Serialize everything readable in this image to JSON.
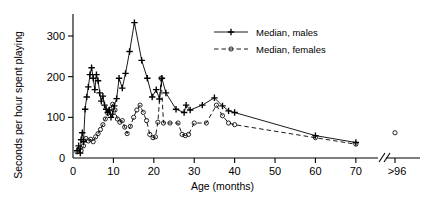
{
  "chart_data": {
    "type": "line",
    "title": "",
    "xlabel": "Age (months)",
    "ylabel": "Seconds per hour spent playing",
    "xlim": [
      0,
      74
    ],
    "ylim": [
      0,
      340
    ],
    "grid": false,
    "legend_position": "top-right",
    "x_ticks": [
      0,
      10,
      20,
      30,
      40,
      50,
      60,
      70
    ],
    "x_tick_labels": [
      "0",
      "10",
      "20",
      "30",
      "40",
      "50",
      "60",
      "70"
    ],
    "axis_break_label": ">96",
    "axis_break_symbol": "//",
    "y_ticks": [
      0,
      100,
      200,
      300
    ],
    "y_tick_labels": [
      "0",
      "100",
      "200",
      "300"
    ],
    "series": [
      {
        "name": "Median, males",
        "marker": "plus",
        "linestyle": "solid",
        "points": [
          [
            1.0,
            18
          ],
          [
            1.4,
            30
          ],
          [
            1.8,
            12
          ],
          [
            2.0,
            45
          ],
          [
            2.3,
            62
          ],
          [
            2.6,
            40
          ],
          [
            3.0,
            120
          ],
          [
            3.4,
            150
          ],
          [
            3.8,
            175
          ],
          [
            4.2,
            205
          ],
          [
            4.6,
            222
          ],
          [
            5.0,
            196
          ],
          [
            5.4,
            168
          ],
          [
            5.8,
            205
          ],
          [
            6.2,
            190
          ],
          [
            6.6,
            160
          ],
          [
            7.0,
            140
          ],
          [
            7.4,
            152
          ],
          [
            7.8,
            130
          ],
          [
            8.2,
            120
          ],
          [
            8.6,
            112
          ],
          [
            9.0,
            118
          ],
          [
            9.4,
            100
          ],
          [
            9.8,
            108
          ],
          [
            10.2,
            128
          ],
          [
            10.8,
            146
          ],
          [
            11.4,
            196
          ],
          [
            12.2,
            172
          ],
          [
            13.0,
            208
          ],
          [
            14.0,
            262
          ],
          [
            15.2,
            333
          ],
          [
            17.0,
            240
          ],
          [
            18.4,
            196
          ],
          [
            19.6,
            150
          ],
          [
            20.6,
            168
          ],
          [
            21.4,
            145
          ],
          [
            22.0,
            196
          ],
          [
            23.0,
            160
          ],
          [
            25.5,
            120
          ],
          [
            27.5,
            112
          ],
          [
            28.0,
            130
          ],
          [
            29.0,
            118
          ],
          [
            32.0,
            130
          ],
          [
            35.0,
            148
          ],
          [
            37.0,
            128
          ],
          [
            38.5,
            116
          ],
          [
            40.0,
            112
          ],
          [
            60.0,
            55
          ],
          [
            70.0,
            38
          ]
        ]
      },
      {
        "name": "Median, females",
        "marker": "circle",
        "linestyle": "dashed",
        "points": [
          [
            1.0,
            15
          ],
          [
            1.5,
            22
          ],
          [
            2.0,
            18
          ],
          [
            2.6,
            30
          ],
          [
            3.2,
            48
          ],
          [
            3.8,
            42
          ],
          [
            4.4,
            46
          ],
          [
            5.0,
            40
          ],
          [
            5.6,
            52
          ],
          [
            6.2,
            60
          ],
          [
            6.8,
            70
          ],
          [
            7.4,
            82
          ],
          [
            8.0,
            96
          ],
          [
            8.6,
            110
          ],
          [
            9.2,
            120
          ],
          [
            9.8,
            132
          ],
          [
            10.4,
            118
          ],
          [
            11.0,
            96
          ],
          [
            11.6,
            88
          ],
          [
            12.2,
            92
          ],
          [
            12.8,
            76
          ],
          [
            13.4,
            60
          ],
          [
            14.2,
            78
          ],
          [
            15.0,
            100
          ],
          [
            15.8,
            118
          ],
          [
            16.6,
            130
          ],
          [
            17.4,
            112
          ],
          [
            18.2,
            92
          ],
          [
            19.0,
            58
          ],
          [
            19.8,
            50
          ],
          [
            20.4,
            52
          ],
          [
            21.0,
            88
          ],
          [
            21.8,
            196
          ],
          [
            22.4,
            86
          ],
          [
            24.0,
            86
          ],
          [
            26.0,
            86
          ],
          [
            27.0,
            58
          ],
          [
            27.8,
            55
          ],
          [
            28.6,
            58
          ],
          [
            30.0,
            86
          ],
          [
            33.0,
            86
          ],
          [
            35.5,
            130
          ],
          [
            37.0,
            104
          ],
          [
            38.5,
            86
          ],
          [
            40.0,
            82
          ],
          [
            60.0,
            50
          ],
          [
            70.0,
            34
          ]
        ]
      }
    ],
    "extra_markers": [
      {
        "series": "Median, females",
        "x_label": ">96",
        "y": 62,
        "marker": "circle"
      }
    ]
  },
  "legend": {
    "items": [
      {
        "label": "Median, males",
        "marker": "plus",
        "linestyle": "solid"
      },
      {
        "label": "Median, females",
        "marker": "circle",
        "linestyle": "dashed"
      }
    ]
  },
  "axes": {
    "x_title": "Age (months)",
    "y_title": "Seconds per hour spent playing"
  }
}
